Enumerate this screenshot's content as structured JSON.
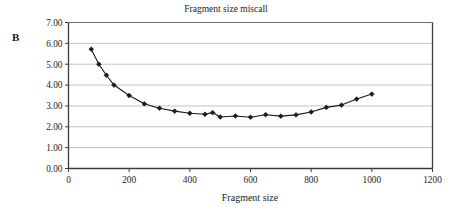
{
  "panel": {
    "label": "B"
  },
  "chart_data": {
    "type": "line",
    "title": "Fragment size miscall",
    "xlabel": "Fragment size",
    "ylabel": "",
    "xlim": [
      0,
      1200
    ],
    "ylim": [
      0,
      7
    ],
    "xticks": [
      0,
      200,
      400,
      600,
      800,
      1000,
      1200
    ],
    "xtick_labels": [
      "0",
      "200",
      "400",
      "600",
      "800",
      "1000",
      "1200"
    ],
    "yticks": [
      0,
      1,
      2,
      3,
      4,
      5,
      6,
      7
    ],
    "ytick_labels": [
      "0.00",
      "1.00",
      "2.00",
      "3.00",
      "4.00",
      "5.00",
      "6.00",
      "7.00"
    ],
    "grid": "horizontal",
    "legend": null,
    "marker": "diamond",
    "line_color": "#1a1a1a",
    "marker_color": "#1a1a1a",
    "grid_color": "#b4b4b4",
    "axis_color": "#3c3c3c",
    "background": "#ffffff",
    "series": [
      {
        "name": "Fragment size miscall",
        "x": [
          75,
          100,
          125,
          150,
          200,
          250,
          300,
          350,
          400,
          450,
          475,
          500,
          550,
          600,
          650,
          700,
          750,
          800,
          850,
          900,
          950,
          1000
        ],
        "values": [
          5.72,
          5.0,
          4.47,
          4.0,
          3.5,
          3.1,
          2.89,
          2.75,
          2.65,
          2.6,
          2.68,
          2.47,
          2.52,
          2.46,
          2.58,
          2.51,
          2.57,
          2.71,
          2.93,
          3.04,
          3.33,
          3.57
        ]
      }
    ]
  }
}
